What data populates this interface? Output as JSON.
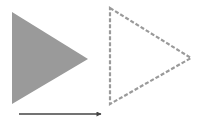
{
  "diagram": {
    "colors": {
      "background": "#ffffff",
      "filled_triangle": "#9a9a9a",
      "dashed_outline": "#9a9a9a",
      "arrow": "#444444"
    },
    "shapes": [
      {
        "name": "original-triangle",
        "style": "filled",
        "points": [
          [
            12,
            12
          ],
          [
            88,
            59
          ],
          [
            12,
            104
          ]
        ]
      },
      {
        "name": "translated-triangle",
        "style": "dashed-outline",
        "points": [
          [
            110,
            8
          ],
          [
            191,
            58
          ],
          [
            110,
            104
          ]
        ]
      },
      {
        "name": "translation-arrow",
        "style": "arrow",
        "from": [
          19,
          114
        ],
        "to": [
          101,
          114
        ]
      }
    ]
  }
}
